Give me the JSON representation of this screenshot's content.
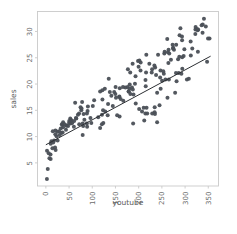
{
  "figure": {
    "background_color": "#ffffff",
    "point_color": "#4a4f56",
    "line_color": "#2c2f33",
    "spine_color": "#c9c9c9",
    "tick_label_color": "#6b6b6b",
    "axis_title_color": "#5a5a5a"
  },
  "chart_data": {
    "type": "scatter",
    "title": "",
    "xlabel": "youtube",
    "ylabel": "sales",
    "xlim": [
      -18,
      372
    ],
    "ylim": [
      0.6,
      33.8
    ],
    "xticks": [
      0,
      50,
      100,
      150,
      200,
      250,
      300,
      350
    ],
    "yticks": [
      5,
      10,
      15,
      20,
      25,
      30
    ],
    "xtick_labels": [
      "0",
      "50",
      "100",
      "150",
      "200",
      "250",
      "300",
      "350"
    ],
    "ytick_labels": [
      "5",
      "10",
      "15",
      "20",
      "25",
      "30"
    ],
    "xtick_label_rotation": 90,
    "ytick_label_rotation": 90,
    "grid": false,
    "legend": null,
    "marker": "circle",
    "marker_size": 2.0,
    "fit_line": {
      "type": "linear-regression",
      "intercept": 8.44,
      "slope": 0.0475,
      "x_start": 0,
      "x_end": 355,
      "y_start": 8.44,
      "y_end": 25.3
    },
    "x": [
      276.12,
      53.4,
      20.64,
      181.8,
      216.96,
      10.44,
      69.0,
      144.24,
      10.32,
      239.76,
      79.32,
      257.64,
      28.56,
      117.0,
      244.92,
      234.48,
      81.36,
      337.68,
      83.04,
      176.76,
      262.08,
      284.88,
      15.84,
      273.96,
      74.76,
      315.48,
      171.48,
      288.12,
      298.44,
      303.96,
      229.2,
      121.92,
      347.4,
      25.08,
      289.92,
      15.0,
      60.36,
      287.52,
      252.96,
      35.28,
      322.32,
      78.12,
      151.08,
      263.04,
      207.24,
      269.52,
      23.04,
      157.8,
      199.8,
      11.88,
      54.84,
      322.08,
      161.16,
      239.76,
      312.36,
      60.96,
      180.72,
      312.0,
      180.0,
      246.24,
      123.24,
      192.0,
      127.08,
      20.4,
      63.12,
      120.72,
      294.0,
      134.04,
      204.24,
      37.08,
      112.8,
      88.32,
      178.2,
      204.0,
      14.16,
      21.0,
      135.48,
      293.52,
      43.8,
      150.24,
      241.8,
      64.8,
      186.96,
      235.44,
      10.08,
      80.4,
      344.64,
      264.0,
      65.64,
      265.08,
      104.04,
      53.64,
      247.32,
      280.8,
      296.88,
      340.68,
      234.36,
      281.64,
      228.96,
      117.0,
      166.2,
      254.16,
      280.32,
      325.44,
      37.2,
      90.6,
      147.24,
      327.6,
      121.8,
      198.6,
      158.52,
      214.44,
      338.04,
      261.6,
      255.24,
      120.96,
      43.32,
      158.88,
      352.68,
      237.48,
      50.04,
      293.28,
      52.56,
      182.16,
      212.04,
      34.44,
      71.88,
      210.84,
      185.52,
      29.88,
      137.88,
      322.68,
      187.32,
      97.92,
      250.44,
      25.32,
      153.6,
      141.12,
      335.64,
      278.52,
      88.92,
      215.88,
      176.28,
      264.36,
      188.04,
      89.88,
      246.96,
      216.48,
      47.88,
      88.44,
      308.04,
      255.96,
      123.84,
      292.08,
      228.12,
      17.64,
      33.24,
      201.48,
      127.92,
      327.12,
      178.68,
      45.0,
      265.92,
      133.2,
      96.12,
      36.12,
      328.08,
      193.68,
      166.8,
      274.32,
      214.68,
      193.2,
      19.8,
      222.96,
      7.68,
      50.4,
      76.44,
      101.16,
      235.08,
      273.12,
      293.76,
      79.44,
      71.52,
      32.04,
      188.88,
      286.32,
      201.0,
      159.24,
      233.88,
      149.76,
      39.84,
      218.4,
      56.76,
      349.44,
      215.16,
      76.92,
      4.08,
      2.28,
      2.52,
      6.12
    ],
    "y": [
      26.52,
      12.48,
      11.16,
      22.2,
      15.48,
      8.64,
      14.16,
      15.84,
      5.76,
      12.72,
      10.32,
      20.88,
      11.04,
      11.64,
      15.96,
      15.6,
      14.28,
      29.76,
      13.2,
      22.8,
      17.4,
      24.72,
      8.88,
      26.76,
      15.6,
      26.76,
      19.32,
      29.28,
      26.64,
      20.88,
      14.4,
      17.04,
      24.24,
      10.92,
      30.6,
      11.04,
      11.88,
      25.2,
      22.44,
      12.24,
      30.36,
      16.56,
      17.4,
      26.04,
      14.76,
      24.6,
      10.08,
      17.52,
      23.28,
      9.12,
      13.08,
      29.52,
      17.16,
      18.36,
      25.44,
      12.96,
      19.92,
      28.08,
      19.08,
      21.24,
      15.0,
      20.04,
      19.08,
      10.44,
      16.44,
      12.36,
      22.92,
      16.2,
      24.12,
      11.76,
      13.68,
      12.48,
      18.6,
      22.56,
      7.8,
      7.44,
      21.0,
      28.32,
      12.12,
      19.44,
      25.56,
      13.56,
      23.88,
      23.16,
      6.6,
      12.0,
      30.96,
      24.0,
      13.44,
      20.88,
      16.92,
      13.2,
      19.08,
      27.48,
      25.32,
      32.4,
      14.64,
      20.52,
      22.8,
      18.6,
      19.44,
      21.96,
      22.08,
      30.48,
      12.72,
      15.72,
      18.48,
      26.16,
      18.84,
      24.36,
      17.64,
      14.4,
      31.32,
      28.56,
      25.8,
      14.16,
      11.28,
      13.8,
      28.68,
      21.72,
      12.6,
      29.04,
      13.44,
      18.12,
      13.08,
      12.36,
      12.36,
      15.48,
      19.32,
      10.32,
      18.48,
      30.84,
      18.96,
      12.6,
      20.64,
      9.24,
      14.04,
      17.76,
      31.2,
      18.36,
      11.88,
      22.2,
      19.44,
      26.52,
      12.48,
      14.88,
      22.56,
      25.56,
      12.0,
      14.4,
      21.0,
      26.16,
      12.6,
      21.96,
      22.2,
      9.24,
      10.68,
      24.48,
      14.76,
      30.24,
      18.6,
      12.12,
      25.8,
      14.04,
      13.56,
      10.8,
      30.36,
      16.32,
      16.8,
      26.88,
      20.76,
      21.48,
      7.92,
      23.88,
      5.88,
      12.96,
      15.0,
      15.84,
      14.28,
      27.48,
      25.08,
      12.48,
      14.4,
      11.52,
      18.0,
      22.08,
      15.24,
      19.2,
      23.52,
      18.12,
      12.36,
      14.4,
      12.6,
      28.68,
      19.56,
      15.36,
      3.84,
      1.92,
      7.32,
      6.84
    ]
  }
}
